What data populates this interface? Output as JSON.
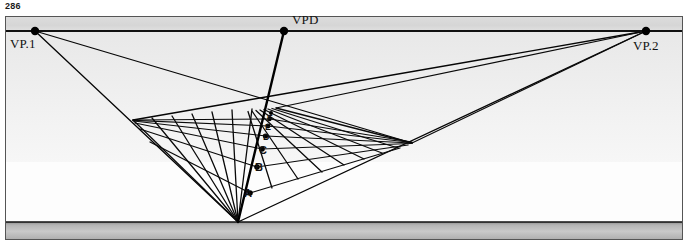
{
  "page": {
    "number": "286"
  },
  "figure": {
    "colors": {
      "ink": "#000000",
      "sky_band": "#d9d9d9",
      "ground_upper": "#ebebeb",
      "ground_lower": "#f7f7f7",
      "bottom_band_dark": "#9a9a9a",
      "bottom_band_light": "#cfcfcf",
      "border": "#4d4d4d",
      "paper": "#ffffff"
    },
    "horizon_label": "HL",
    "vanishing_points": [
      {
        "id": "vp1",
        "label": "VP.1",
        "x": 35,
        "y": 19,
        "label_x": 10,
        "label_y": 25
      },
      {
        "id": "vpd",
        "label": "VPD",
        "x": 284,
        "y": 19,
        "label_x": 293,
        "label_y": 1
      },
      {
        "id": "vp2",
        "label": "VP.2",
        "x": 646,
        "y": 19,
        "label_x": 634,
        "label_y": 28
      }
    ],
    "horizon_line": {
      "y": 19,
      "x1": 6,
      "x2": 682,
      "label_x": 410,
      "label_y": 25
    },
    "station_point": {
      "x": 238,
      "y": 210
    },
    "measuring_points": [
      {
        "label": "A",
        "x": 250,
        "y": 181,
        "label_x": 245,
        "label_y": 182
      },
      {
        "label": "B",
        "x": 257,
        "y": 155,
        "label_x": 256,
        "label_y": 160
      },
      {
        "label": "C",
        "x": 262,
        "y": 137,
        "label_x": 260,
        "label_y": 141
      },
      {
        "label": "D",
        "x": 266,
        "y": 124,
        "label_x": 264,
        "label_y": 127
      },
      {
        "label": "E",
        "x": 268,
        "y": 114,
        "label_x": 267,
        "label_y": 117
      },
      {
        "label": "F",
        "x": 270,
        "y": 107,
        "label_x": 269,
        "label_y": 109
      }
    ],
    "left_edge_point": {
      "x": 133,
      "y": 108
    },
    "right_edge_point": {
      "x": 412,
      "y": 131
    },
    "convergence_top": {
      "x": 272,
      "y": 96
    }
  }
}
